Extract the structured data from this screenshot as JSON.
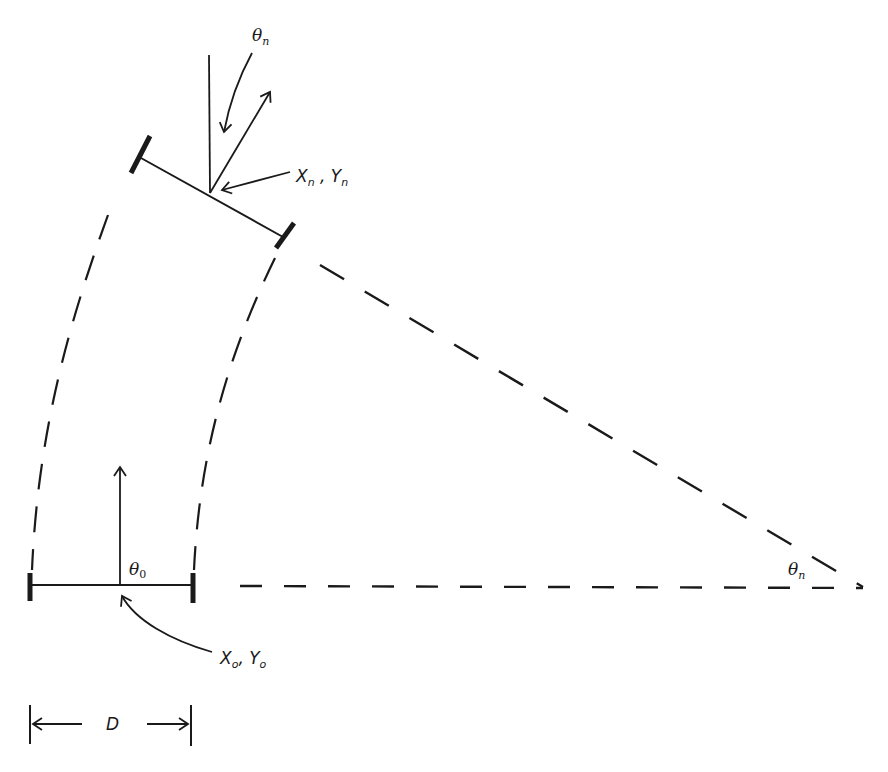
{
  "diagram": {
    "type": "geometry",
    "labels": {
      "theta_n_top": {
        "base": "θ",
        "sub": "n"
      },
      "xn_yn": {
        "x": "X",
        "xsub": "n",
        "sep": " , ",
        "y": "Y",
        "ysub": "n"
      },
      "theta_0": {
        "base": "θ",
        "sub": "0"
      },
      "x0_y0": {
        "x": "X",
        "xsub": "o",
        "sep": ", ",
        "y": "Y",
        "ysub": "o"
      },
      "theta_n_pivot": {
        "base": "θ",
        "sub": "n"
      },
      "d": "D"
    },
    "colors": {
      "stroke": "#1a1a1a",
      "background": "#ffffff"
    }
  }
}
